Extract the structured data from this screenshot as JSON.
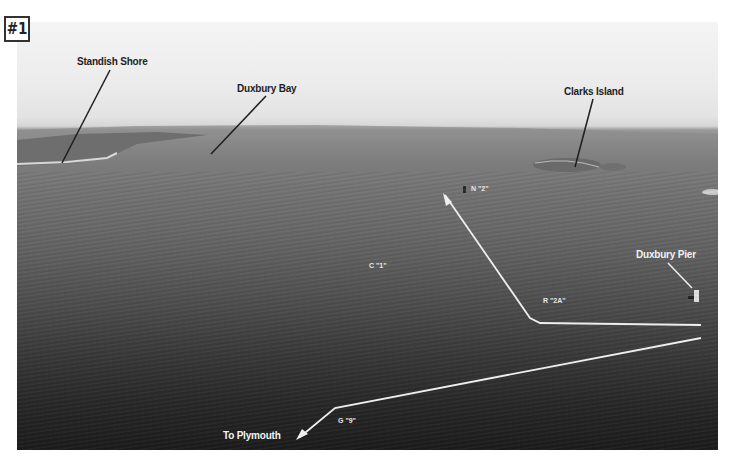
{
  "figure": {
    "number_badge": "#1"
  },
  "labels": {
    "standish_shore": "Standish Shore",
    "duxbury_bay": "Duxbury Bay",
    "clarks_island": "Clarks Island",
    "duxbury_pier": "Duxbury Pier",
    "to_plymouth": "To Plymouth"
  },
  "markers": {
    "n2": "N \"2\"",
    "c1": "C \"1\"",
    "r2a": "R \"2A\"",
    "g9": "G \"9\""
  },
  "colors": {
    "frame": "#ffffff",
    "route_line": "#eeeeee",
    "leader_line_dark": "#1e1e1e",
    "leader_line_light": "#eeeeee"
  }
}
